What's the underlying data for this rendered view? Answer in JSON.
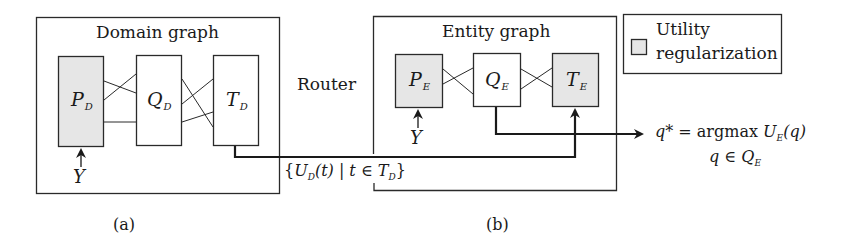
{
  "colors": {
    "stroke": "#2a2a2a",
    "shaded_fill": "#e6e6e6",
    "background": "#ffffff"
  },
  "domain_graph": {
    "title": "Domain graph",
    "nodes": [
      {
        "id": "P_D",
        "main": "P",
        "sub": "D",
        "shaded": true
      },
      {
        "id": "Q_D",
        "main": "Q",
        "sub": "D",
        "shaded": false
      },
      {
        "id": "T_D",
        "main": "T",
        "sub": "D",
        "shaded": false
      }
    ],
    "input_label": "Y",
    "caption": "(a)"
  },
  "router": {
    "label": "Router",
    "message": {
      "open": "{",
      "U": "U",
      "U_sub": "D",
      "arg": "(t) | t ∈ ",
      "T": "T",
      "T_sub": "D",
      "close": "}"
    }
  },
  "entity_graph": {
    "title": "Entity graph",
    "nodes": [
      {
        "id": "P_E",
        "main": "P",
        "sub": "E",
        "shaded": true
      },
      {
        "id": "Q_E",
        "main": "Q",
        "sub": "E",
        "shaded": false
      },
      {
        "id": "T_E",
        "main": "T",
        "sub": "E",
        "shaded": true
      }
    ],
    "input_label": "Y",
    "caption": "(b)"
  },
  "legend": {
    "line1": "Utility",
    "line2": "regularization"
  },
  "output_equation": {
    "lhs": "q*",
    "eq": " = argmax ",
    "U": "U",
    "U_sub": "E",
    "arg": "(q)",
    "cond_prefix": "q ∈ Q",
    "cond_sub": "E"
  }
}
